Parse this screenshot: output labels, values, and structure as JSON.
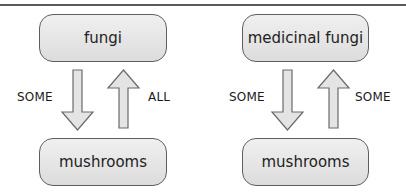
{
  "diagrams": [
    {
      "top_box": "fungi",
      "bottom_box": "mushrooms",
      "down_label": "SOME",
      "up_label": "ALL"
    },
    {
      "top_box": "medicinal fungi",
      "bottom_box": "mushrooms",
      "down_label": "SOME",
      "up_label": "SOME"
    }
  ],
  "colors": {
    "box_fill": "#e6e6e6",
    "box_border": "#5e5e5e",
    "arrow_fill": "#e4e4e4",
    "arrow_border": "#6a6a6a"
  }
}
